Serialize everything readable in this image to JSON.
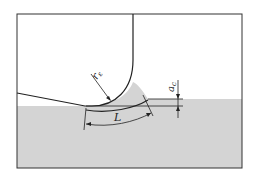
{
  "diagram": {
    "labels": {
      "nose_radius": "r",
      "nose_radius_sub": "ε",
      "contact_length": "L",
      "depth": "a",
      "depth_sub": "c"
    },
    "colors": {
      "workpiece": "#d4d4d4",
      "line": "#222222",
      "background": "#ffffff"
    }
  }
}
